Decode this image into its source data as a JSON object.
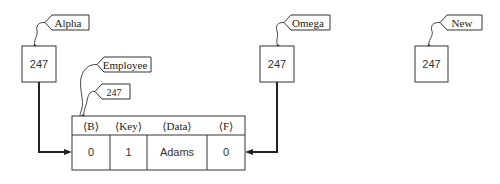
{
  "diagram": {
    "pointers": [
      {
        "id": "alpha",
        "tag": "Alpha",
        "value": "247"
      },
      {
        "id": "omega",
        "tag": "Omega",
        "value": "247"
      },
      {
        "id": "new",
        "tag": "New",
        "value": "247"
      }
    ],
    "record": {
      "type_tag": "Employee",
      "address_tag": "247",
      "headers": [
        "⟨B⟩",
        "⟨Key⟩",
        "⟨Data⟩",
        "⟨F⟩"
      ],
      "values": [
        "0",
        "1",
        "Adams",
        "0"
      ]
    },
    "colors": {
      "line": "#333333",
      "background": "#ffffff"
    }
  }
}
